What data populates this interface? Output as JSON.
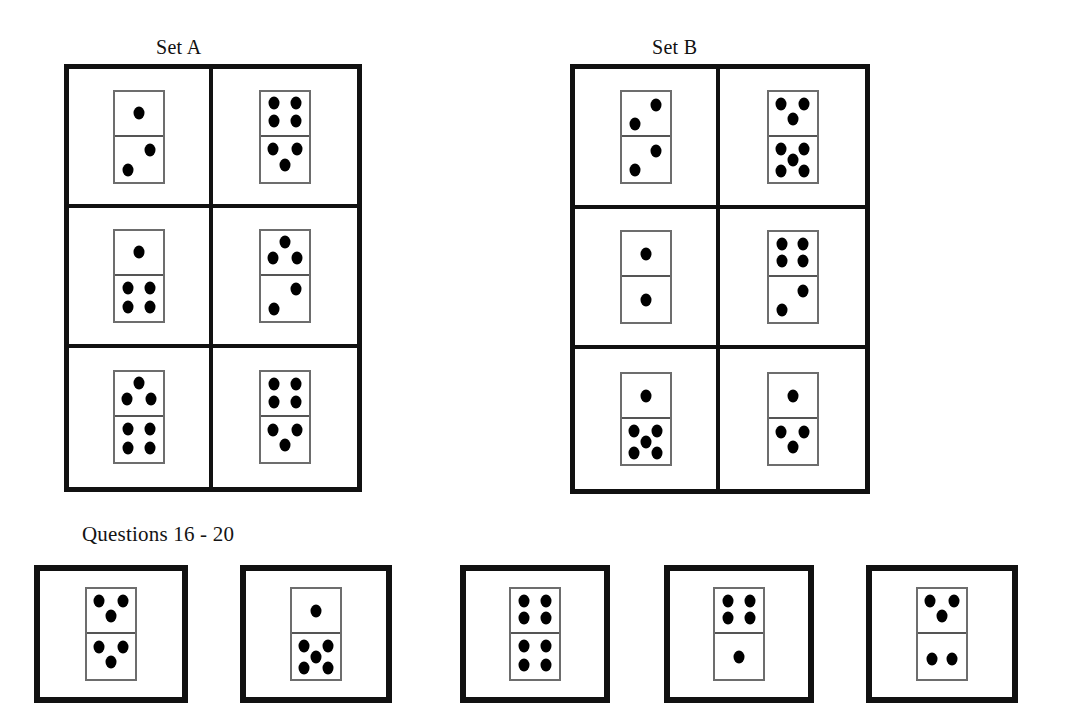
{
  "page": {
    "background_color": "#ffffff",
    "ink_color": "#111111"
  },
  "sets": [
    {
      "id": "set-a",
      "caption": "Set A",
      "caption_x": 156,
      "caption_y": 36,
      "grid": {
        "x": 64,
        "y": 64,
        "width": 298,
        "height": 428
      },
      "cells": [
        {
          "index": 0,
          "row": 0,
          "col": 0,
          "top_pips": 1,
          "bottom_pips": 2,
          "top_pattern": "1-center",
          "bottom_pattern": "2-diagonal-up"
        },
        {
          "index": 1,
          "row": 0,
          "col": 1,
          "top_pips": 4,
          "bottom_pips": 3,
          "top_pattern": "4-corners",
          "bottom_pattern": "3-triangle-down"
        },
        {
          "index": 2,
          "row": 1,
          "col": 0,
          "top_pips": 1,
          "bottom_pips": 4,
          "top_pattern": "1-center",
          "bottom_pattern": "4-corners"
        },
        {
          "index": 3,
          "row": 1,
          "col": 1,
          "top_pips": 3,
          "bottom_pips": 2,
          "top_pattern": "3-triangle-up",
          "bottom_pattern": "2-diagonal-up"
        },
        {
          "index": 4,
          "row": 2,
          "col": 0,
          "top_pips": 3,
          "bottom_pips": 4,
          "top_pattern": "3-triangle-up",
          "bottom_pattern": "4-corners"
        },
        {
          "index": 5,
          "row": 2,
          "col": 1,
          "top_pips": 4,
          "bottom_pips": 3,
          "top_pattern": "4-corners",
          "bottom_pattern": "3-triangle-down"
        }
      ]
    },
    {
      "id": "set-b",
      "caption": "Set B",
      "caption_x": 652,
      "caption_y": 36,
      "grid": {
        "x": 570,
        "y": 64,
        "width": 300,
        "height": 430
      },
      "cells": [
        {
          "index": 0,
          "row": 0,
          "col": 0,
          "top_pips": 2,
          "bottom_pips": 2,
          "top_pattern": "2-diagonal-up",
          "bottom_pattern": "2-diagonal-up"
        },
        {
          "index": 1,
          "row": 0,
          "col": 1,
          "top_pips": 3,
          "bottom_pips": 5,
          "top_pattern": "3-triangle-down",
          "bottom_pattern": "5-quincunx"
        },
        {
          "index": 2,
          "row": 1,
          "col": 0,
          "top_pips": 1,
          "bottom_pips": 1,
          "top_pattern": "1-center",
          "bottom_pattern": "1-center"
        },
        {
          "index": 3,
          "row": 1,
          "col": 1,
          "top_pips": 4,
          "bottom_pips": 2,
          "top_pattern": "4-corners",
          "bottom_pattern": "2-diagonal-up"
        },
        {
          "index": 4,
          "row": 2,
          "col": 0,
          "top_pips": 1,
          "bottom_pips": 5,
          "top_pattern": "1-center",
          "bottom_pattern": "5-quincunx"
        },
        {
          "index": 5,
          "row": 2,
          "col": 1,
          "top_pips": 1,
          "bottom_pips": 3,
          "top_pattern": "1-center",
          "bottom_pattern": "3-triangle-down"
        }
      ]
    }
  ],
  "questions": {
    "label": "Questions 16 - 20",
    "label_x": 82,
    "label_y": 522,
    "options": [
      {
        "id": "option-1",
        "x": 34,
        "y": 565,
        "width": 154,
        "height": 138,
        "top_pips": 3,
        "bottom_pips": 3,
        "top_pattern": "3-triangle-down",
        "bottom_pattern": "3-triangle-down"
      },
      {
        "id": "option-2",
        "x": 240,
        "y": 565,
        "width": 152,
        "height": 138,
        "top_pips": 1,
        "bottom_pips": 5,
        "top_pattern": "1-center",
        "bottom_pattern": "5-quincunx"
      },
      {
        "id": "option-3",
        "x": 460,
        "y": 565,
        "width": 150,
        "height": 138,
        "top_pips": 4,
        "bottom_pips": 4,
        "top_pattern": "4-corners",
        "bottom_pattern": "4-corners"
      },
      {
        "id": "option-4",
        "x": 664,
        "y": 565,
        "width": 150,
        "height": 138,
        "top_pips": 4,
        "bottom_pips": 1,
        "top_pattern": "4-corners",
        "bottom_pattern": "1-center"
      },
      {
        "id": "option-5",
        "x": 866,
        "y": 565,
        "width": 152,
        "height": 138,
        "top_pips": 3,
        "bottom_pips": 2,
        "top_pattern": "3-triangle-down",
        "bottom_pattern": "2-horizontal"
      }
    ]
  },
  "pip_layouts": {
    "1-center": [
      [
        50,
        50
      ]
    ],
    "2-diagonal-up": [
      [
        72,
        30
      ],
      [
        28,
        74
      ]
    ],
    "2-horizontal": [
      [
        30,
        55
      ],
      [
        70,
        55
      ]
    ],
    "3-triangle-up": [
      [
        50,
        25
      ],
      [
        24,
        62
      ],
      [
        76,
        62
      ]
    ],
    "3-triangle-down": [
      [
        26,
        28
      ],
      [
        74,
        28
      ],
      [
        50,
        62
      ]
    ],
    "4-corners": [
      [
        28,
        27
      ],
      [
        72,
        27
      ],
      [
        28,
        68
      ],
      [
        72,
        68
      ]
    ],
    "5-quincunx": [
      [
        26,
        26
      ],
      [
        74,
        26
      ],
      [
        50,
        50
      ],
      [
        26,
        76
      ],
      [
        74,
        76
      ]
    ]
  }
}
